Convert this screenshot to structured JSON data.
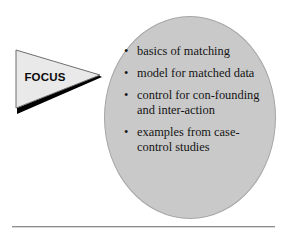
{
  "page": {
    "background_color": "#ffffff",
    "width": 287,
    "height": 235
  },
  "banner": {
    "label": "FOCUS",
    "shape": "right-pointing-triangle",
    "fill_color": "#e9e9e9",
    "outline_color": "#6e6e6e",
    "shadow_color": "#000000"
  },
  "ellipse": {
    "fill_color": "#c9c9c9",
    "outline_color": "#a6a6a6"
  },
  "bullets": {
    "marker": "•",
    "items": [
      {
        "text": "basics of matching"
      },
      {
        "text": "model for matched data"
      },
      {
        "text": "control for con-founding and inter-action"
      },
      {
        "text": "examples from case-control studies"
      }
    ]
  },
  "divider": {
    "color": "#8d8d8d"
  }
}
